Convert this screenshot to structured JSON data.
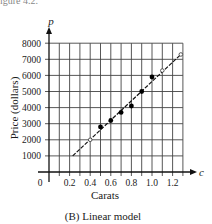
{
  "figure_header_fragment": "igure 4.2.",
  "chart_data": {
    "type": "scatter",
    "title": "",
    "caption": "(B) Linear model",
    "xlabel": "Carats",
    "ylabel": "Price (dollars)",
    "x_var": "c",
    "y_var": "p",
    "origin_label": "0",
    "xlim": [
      0,
      1.3
    ],
    "ylim": [
      0,
      8000
    ],
    "x_ticks": [
      0.2,
      0.4,
      0.6,
      0.8,
      1.0,
      1.2
    ],
    "x_tick_labels": [
      "0.2",
      "0.4",
      "0.6",
      "0.8",
      "1.0",
      "1.2"
    ],
    "y_ticks": [
      1000,
      2000,
      3000,
      4000,
      5000,
      6000,
      7000,
      8000
    ],
    "y_tick_labels": [
      "1000",
      "2000",
      "3000",
      "4000",
      "5000",
      "6000",
      "7000",
      "8000"
    ],
    "grid": true,
    "x_grid_step": 0.1,
    "y_grid_step": 1000,
    "series": [
      {
        "name": "data points",
        "marker": "filled-circle",
        "x": [
          0.5,
          0.6,
          0.7,
          0.8,
          0.9,
          1.0
        ],
        "y": [
          2800,
          3200,
          3700,
          4100,
          5000,
          5900
        ]
      },
      {
        "name": "linear model",
        "style": "dashed-line",
        "x": [
          0.23,
          1.28
        ],
        "y": [
          1000,
          7300
        ],
        "open_markers_x": [
          0.4,
          1.1,
          1.28
        ],
        "open_markers_y": [
          2000,
          6300,
          7300
        ]
      }
    ]
  }
}
